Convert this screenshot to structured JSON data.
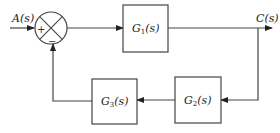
{
  "diagram": {
    "type": "block-diagram",
    "input_label": "A(s)",
    "output_label": "C(s)",
    "summing_junction": {
      "plus_sign": "+",
      "minus_sign": "−"
    },
    "blocks": [
      {
        "id": "g1",
        "name": "G",
        "sub": "1",
        "suffix": "(s)"
      },
      {
        "id": "g2",
        "name": "G",
        "sub": "2",
        "suffix": "(s)"
      },
      {
        "id": "g3",
        "name": "G",
        "sub": "3",
        "suffix": "(s)"
      }
    ],
    "colors": {
      "line": "#444444",
      "background": "#ffffff"
    }
  }
}
